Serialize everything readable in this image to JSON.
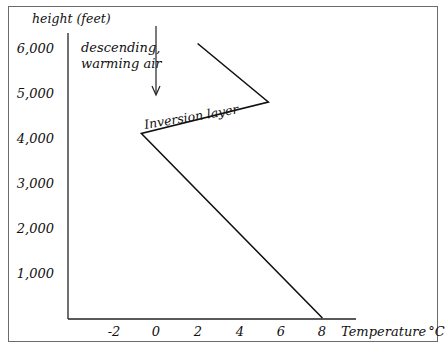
{
  "chart_data": {
    "type": "line",
    "title": "",
    "xlabel": "Temperature °C",
    "ylabel": "height (feet)",
    "x_ticks": [
      "-2",
      "0",
      "2",
      "4",
      "6",
      "8"
    ],
    "y_ticks": [
      "1,000",
      "2,000",
      "3,000",
      "4,000",
      "5,000",
      "6,000"
    ],
    "xlim": [
      -4.5,
      9.5
    ],
    "ylim": [
      0,
      6400
    ],
    "grid": false,
    "legend": null,
    "series": [
      {
        "name": "temperature profile",
        "points": [
          {
            "x": 8,
            "y": 0
          },
          {
            "x": -0.7,
            "y": 4100
          },
          {
            "x": 5.4,
            "y": 4800
          },
          {
            "x": 2,
            "y": 6100
          }
        ]
      }
    ],
    "annotations": [
      {
        "text": "descending,",
        "line2": "warming air",
        "type": "arrow-down",
        "x": 0,
        "y_from": 6900,
        "y_to": 5000
      },
      {
        "text": "Inversion layer",
        "type": "label-along-segment"
      }
    ]
  },
  "labels": {
    "ylabel": "height (feet)",
    "xlabel_text": "Temperature",
    "xlabel_unit": "°C",
    "annotation_line1": "descending,",
    "annotation_line2": "warming air",
    "inversion": "Inversion layer",
    "x_ticks": [
      "-2",
      "0",
      "2",
      "4",
      "6",
      "8"
    ],
    "y_ticks": [
      "1,000",
      "2,000",
      "3,000",
      "4,000",
      "5,000",
      "6,000"
    ]
  },
  "colors": {
    "line": "#111111",
    "frame": "#6b6b6b",
    "background": "#ffffff"
  }
}
